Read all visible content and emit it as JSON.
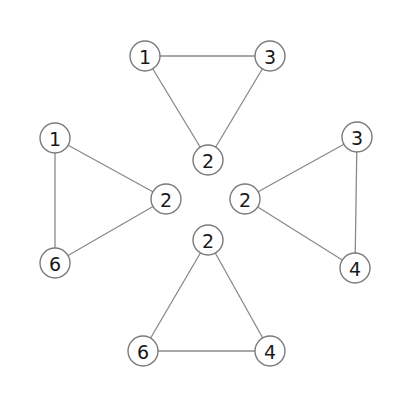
{
  "diagram": {
    "type": "graph",
    "colors": {
      "background": "#ffffff",
      "edge": "#8a8a8a",
      "node_stroke": "#7a7a7a",
      "node_fill": "#ffffff",
      "label": "#1a1a1a"
    },
    "node_radius": 15,
    "triangles": [
      {
        "name": "top",
        "nodes": [
          {
            "id": "t1",
            "label": "1",
            "x": 145,
            "y": 56
          },
          {
            "id": "t3",
            "label": "3",
            "x": 270,
            "y": 56
          },
          {
            "id": "t2",
            "label": "2",
            "x": 208,
            "y": 160
          }
        ],
        "edges": [
          [
            "t1",
            "t3"
          ],
          [
            "t1",
            "t2"
          ],
          [
            "t3",
            "t2"
          ]
        ]
      },
      {
        "name": "left",
        "nodes": [
          {
            "id": "l1",
            "label": "1",
            "x": 55,
            "y": 138
          },
          {
            "id": "l2",
            "label": "2",
            "x": 166,
            "y": 199
          },
          {
            "id": "l6",
            "label": "6",
            "x": 55,
            "y": 263
          }
        ],
        "edges": [
          [
            "l1",
            "l2"
          ],
          [
            "l1",
            "l6"
          ],
          [
            "l2",
            "l6"
          ]
        ]
      },
      {
        "name": "right",
        "nodes": [
          {
            "id": "r3",
            "label": "3",
            "x": 357,
            "y": 137
          },
          {
            "id": "r2",
            "label": "2",
            "x": 245,
            "y": 199
          },
          {
            "id": "r4",
            "label": "4",
            "x": 355,
            "y": 268
          }
        ],
        "edges": [
          [
            "r3",
            "r2"
          ],
          [
            "r3",
            "r4"
          ],
          [
            "r2",
            "r4"
          ]
        ]
      },
      {
        "name": "bottom",
        "nodes": [
          {
            "id": "b2",
            "label": "2",
            "x": 208,
            "y": 240
          },
          {
            "id": "b6",
            "label": "6",
            "x": 143,
            "y": 351
          },
          {
            "id": "b4",
            "label": "4",
            "x": 270,
            "y": 351
          }
        ],
        "edges": [
          [
            "b2",
            "b6"
          ],
          [
            "b2",
            "b4"
          ],
          [
            "b6",
            "b4"
          ]
        ]
      }
    ]
  }
}
